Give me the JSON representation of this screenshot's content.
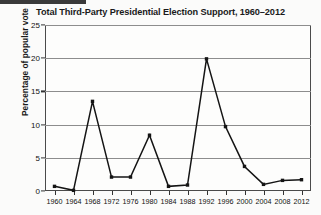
{
  "chart_data": {
    "type": "line",
    "title": "Total Third-Party Presidential Election Support, 1960–2012",
    "xlabel": "",
    "ylabel": "Percentage of popular vote",
    "categories": [
      "1960",
      "1964",
      "1968",
      "1972",
      "1976",
      "1980",
      "1984",
      "1988",
      "1992",
      "1996",
      "2000",
      "2004",
      "2008",
      "2012"
    ],
    "values": [
      0.7,
      0.1,
      13.5,
      2.1,
      2.1,
      8.4,
      0.7,
      0.9,
      19.9,
      9.7,
      3.7,
      1.0,
      1.6,
      1.7
    ],
    "series": [
      {
        "name": "Third-party popular vote share",
        "values": [
          0.7,
          0.1,
          13.5,
          2.1,
          2.1,
          8.4,
          0.7,
          0.9,
          19.9,
          9.7,
          3.7,
          1.0,
          1.6,
          1.7
        ]
      }
    ],
    "ylim": [
      0,
      25
    ],
    "yticks": [
      0,
      5,
      10,
      15,
      20,
      25
    ],
    "ytick_labels": [
      "0",
      "5",
      "10",
      "15",
      "20",
      "25"
    ],
    "xtick_labels": [
      "1960",
      "1964",
      "1968",
      "1972",
      "1976",
      "1980",
      "1984",
      "1988",
      "1992",
      "1996",
      "2000",
      "2004",
      "2008",
      "2012"
    ],
    "grid": "horizontal",
    "legend": "none",
    "line_color": "#141414",
    "marker": "square",
    "background_color": "#fdfdfc",
    "grid_color": "#8d8d8d",
    "axis_color": "#4a4a4a"
  }
}
